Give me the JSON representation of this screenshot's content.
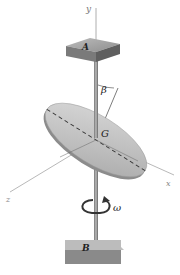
{
  "diagram": {
    "labels": {
      "y_axis": "y",
      "x_axis": "x",
      "z_axis": "z",
      "bearing_top": "A",
      "bearing_bottom": "B",
      "center": "G",
      "tilt_angle": "β",
      "angular_velocity": "ω"
    },
    "colors": {
      "shaft": "#8a8a8a",
      "disk_face": "#c8c8c8",
      "disk_edge": "#8c8c8c",
      "bearing_top": "#a8a8a8",
      "bearing_side": "#6e6e6e",
      "axis_line": "#9a9a9a",
      "rotation_arrow": "#333333"
    }
  }
}
